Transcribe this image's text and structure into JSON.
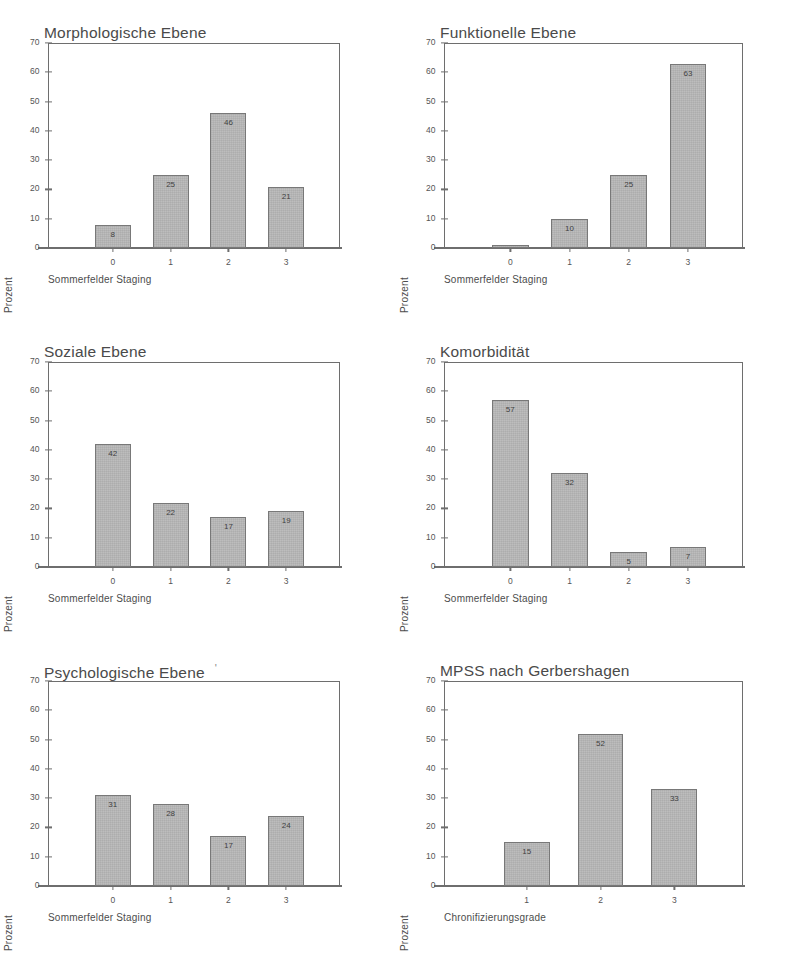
{
  "figure": {
    "panel_count": 6,
    "shared": {
      "ylabel": "Prozent",
      "ylim": [
        0,
        70
      ],
      "yticks": [
        0,
        10,
        20,
        30,
        40,
        50,
        60,
        70
      ],
      "bar_color": "#b9b9b9",
      "bar_edge_color": "#787878",
      "axis_color": "#6e6e6e",
      "background": "#ffffff"
    }
  },
  "chart_data": [
    {
      "type": "bar",
      "title": "Morphologische Ebene",
      "title_mark": "",
      "xlabel": "Sommerfelder Staging",
      "ylabel": "Prozent",
      "categories": [
        "0",
        "1",
        "2",
        "3"
      ],
      "values": [
        8,
        25,
        46,
        21
      ],
      "labels": [
        "8",
        "25",
        "46",
        "21"
      ],
      "ylim": [
        0,
        70
      ],
      "yticks": [
        0,
        10,
        20,
        30,
        40,
        50,
        60,
        70
      ],
      "grid": false,
      "legend": "none"
    },
    {
      "type": "bar",
      "title": "Funktionelle Ebene",
      "title_mark": "",
      "xlabel": "Sommerfelder Staging",
      "ylabel": "Prozent",
      "categories": [
        "0",
        "1",
        "2",
        "3"
      ],
      "values": [
        1,
        10,
        25,
        63
      ],
      "labels": [
        "",
        "10",
        "25",
        "63"
      ],
      "ylim": [
        0,
        70
      ],
      "yticks": [
        0,
        10,
        20,
        30,
        40,
        50,
        60,
        70
      ],
      "grid": false,
      "legend": "none"
    },
    {
      "type": "bar",
      "title": "Soziale Ebene",
      "title_mark": "",
      "xlabel": "Sommerfelder Staging",
      "ylabel": "Prozent",
      "categories": [
        "0",
        "1",
        "2",
        "3"
      ],
      "values": [
        42,
        22,
        17,
        19
      ],
      "labels": [
        "42",
        "22",
        "17",
        "19"
      ],
      "ylim": [
        0,
        70
      ],
      "yticks": [
        0,
        10,
        20,
        30,
        40,
        50,
        60,
        70
      ],
      "grid": false,
      "legend": "none"
    },
    {
      "type": "bar",
      "title": "Komorbidität",
      "title_mark": "",
      "xlabel": "Sommerfelder Staging",
      "ylabel": "Prozent",
      "categories": [
        "0",
        "1",
        "2",
        "3"
      ],
      "values": [
        57,
        32,
        5,
        7
      ],
      "labels": [
        "57",
        "32",
        "5",
        "7"
      ],
      "ylim": [
        0,
        70
      ],
      "yticks": [
        0,
        10,
        20,
        30,
        40,
        50,
        60,
        70
      ],
      "grid": false,
      "legend": "none"
    },
    {
      "type": "bar",
      "title": "Psychologische Ebene",
      "title_mark": "'",
      "xlabel": "Sommerfelder Staging",
      "ylabel": "Prozent",
      "categories": [
        "0",
        "1",
        "2",
        "3"
      ],
      "values": [
        31,
        28,
        17,
        24
      ],
      "labels": [
        "31",
        "28",
        "17",
        "24"
      ],
      "ylim": [
        0,
        70
      ],
      "yticks": [
        0,
        10,
        20,
        30,
        40,
        50,
        60,
        70
      ],
      "grid": false,
      "legend": "none"
    },
    {
      "type": "bar",
      "title": "MPSS nach Gerbershagen",
      "title_mark": "",
      "xlabel": "Chronifizierungsgrade",
      "ylabel": "Prozent",
      "categories": [
        "1",
        "2",
        "3"
      ],
      "values": [
        15,
        52,
        33
      ],
      "labels": [
        "15",
        "52",
        "33"
      ],
      "ylim": [
        0,
        70
      ],
      "yticks": [
        0,
        10,
        20,
        30,
        40,
        50,
        60,
        70
      ],
      "grid": false,
      "legend": "none"
    }
  ]
}
